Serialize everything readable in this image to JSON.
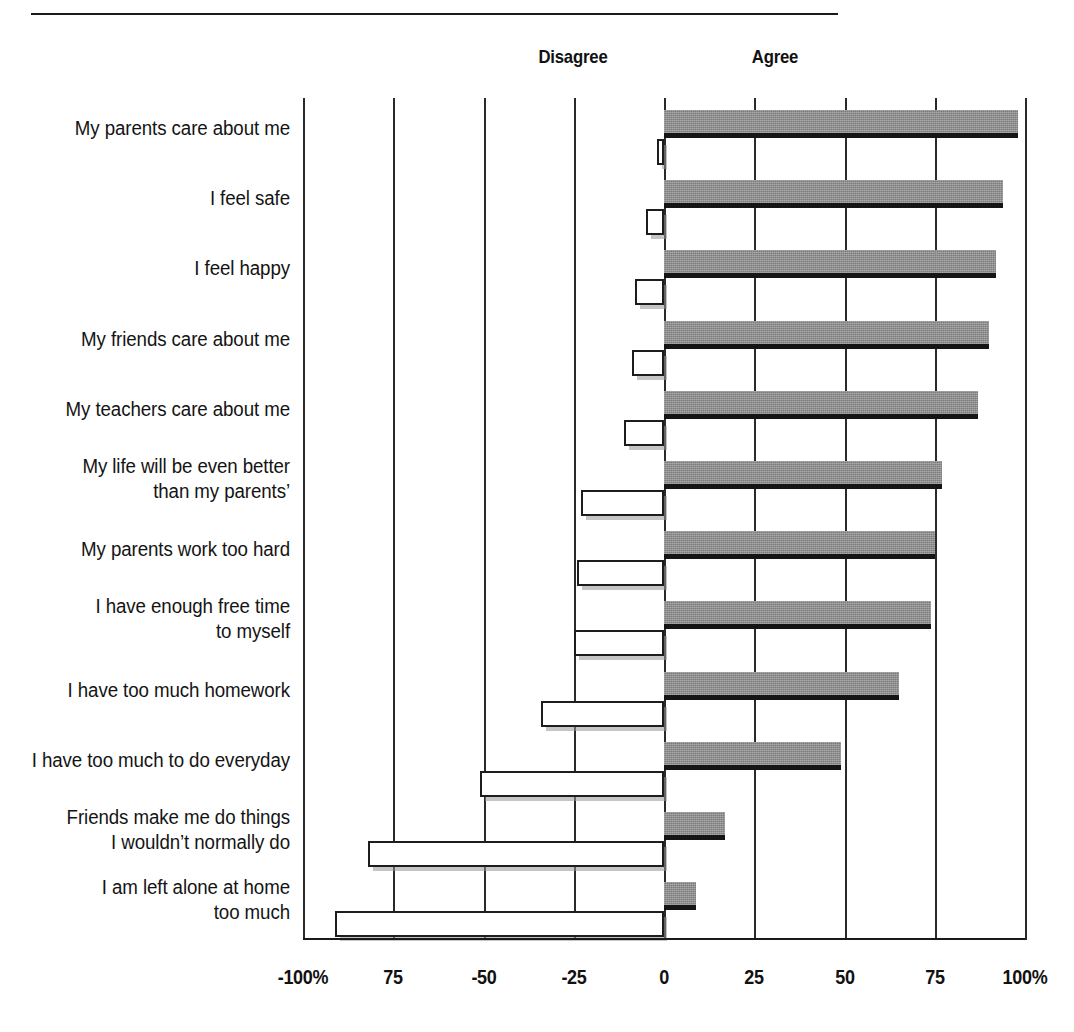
{
  "header": {
    "disagree_label": "Disagree",
    "agree_label": "Agree"
  },
  "axis": {
    "ticks": [
      {
        "value": -100,
        "label": "-100%"
      },
      {
        "value": -75,
        "label": "75"
      },
      {
        "value": -50,
        "label": "-50"
      },
      {
        "value": -25,
        "label": "-25"
      },
      {
        "value": 0,
        "label": "0"
      },
      {
        "value": 25,
        "label": "25"
      },
      {
        "value": 50,
        "label": "50"
      },
      {
        "value": 75,
        "label": "75"
      },
      {
        "value": 100,
        "label": "100%"
      }
    ]
  },
  "colors": {
    "agree_bar": "#8a8a8a",
    "agree_bar_shadow": "#151515",
    "disagree_bar_fill": "#ffffff",
    "disagree_bar_stroke": "#1d1d1d",
    "gridline": "#2a2a2a",
    "text": "#141414"
  },
  "chart_data": {
    "type": "bar",
    "orientation": "horizontal",
    "style": "diverging",
    "title": "",
    "subtitle": "",
    "xlabel": "",
    "ylabel": "",
    "xlim": [
      -100,
      100
    ],
    "grid": true,
    "legend_position": "top",
    "categories": [
      "My parents care about me",
      "I feel safe",
      "I feel happy",
      "My friends care about me",
      "My teachers care about me",
      "My life will be even better\nthan my parents’",
      "My parents work too hard",
      "I have enough free time\nto myself",
      "I have too much homework",
      "I have too much to do everyday",
      "Friends make me do things\nI wouldn’t normally do",
      "I am left alone at home\ntoo much"
    ],
    "series": [
      {
        "name": "Agree",
        "values": [
          98,
          94,
          92,
          90,
          87,
          77,
          75,
          74,
          65,
          49,
          17,
          9
        ]
      },
      {
        "name": "Disagree",
        "values": [
          -2,
          -5,
          -8,
          -9,
          -11,
          -23,
          -24,
          -25,
          -34,
          -51,
          -82,
          -91
        ]
      }
    ]
  }
}
